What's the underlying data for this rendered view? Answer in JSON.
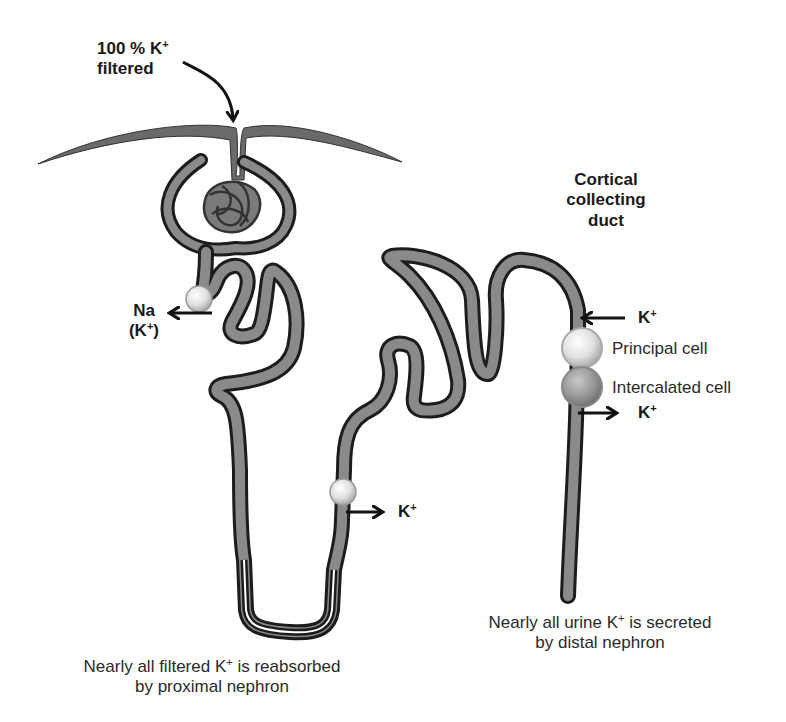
{
  "labels": {
    "filtered_line1": "100 % K",
    "filtered_sup": "+",
    "filtered_line2": "filtered",
    "cortical_line1": "Cortical",
    "cortical_line2": "collecting",
    "cortical_line3": "duct",
    "na_label": "Na",
    "na_k_label_pre": "(K",
    "na_k_label_sup": "+",
    "na_k_label_post": ")",
    "k_loop": "K",
    "k_in": "K",
    "k_out": "K",
    "k_sup": "+",
    "principal_cell": "Principal cell",
    "intercalated_cell": "Intercalated cell",
    "caption_left_a": "Nearly all filtered K",
    "caption_left_b": " is reabsorbed",
    "caption_left_line2": "by proximal nephron",
    "caption_right_a": "Nearly all urine K",
    "caption_right_b": " is secreted",
    "caption_right_line2": "by distal nephron"
  },
  "colors": {
    "tubule_fill": "#8a8a8a",
    "tubule_outline": "#1c1c1c",
    "arrow": "#111111",
    "principal_cell": "#e6e6e6",
    "intercalated_cell": "#9a9a9a",
    "proximal_cell": "#d8d8d8"
  }
}
